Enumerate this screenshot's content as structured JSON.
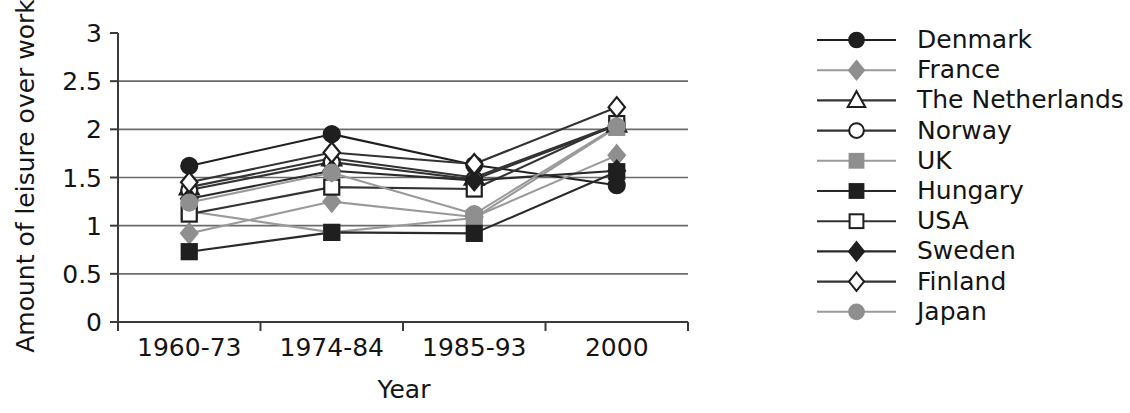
{
  "chart_data": {
    "type": "line",
    "title": "",
    "xlabel": "Year",
    "ylabel": "Amount of leisure over work",
    "categories": [
      "1960-73",
      "1974-84",
      "1985-93",
      "2000"
    ],
    "ylim": [
      0,
      3
    ],
    "yticks": [
      "0",
      "0.5",
      "1",
      "1.5",
      "2",
      "2.5",
      "3"
    ],
    "ytick_values": [
      0,
      0.5,
      1,
      1.5,
      2,
      2.5,
      3
    ],
    "grid": "horizontal",
    "legend_position": "right",
    "series": [
      {
        "name": "Denmark",
        "marker": "filled-circle",
        "color": "#1f1f1f",
        "marker_fill": "#1f1f1f",
        "values": [
          1.62,
          1.95,
          1.63,
          1.42
        ]
      },
      {
        "name": "France",
        "marker": "filled-diamond",
        "color": "#9a9a9a",
        "marker_fill": "#8f8f8f",
        "values": [
          0.92,
          1.25,
          1.09,
          1.73
        ]
      },
      {
        "name": "The Netherlands",
        "marker": "open-triangle",
        "color": "#333333",
        "marker_fill": "#ffffff",
        "values": [
          1.4,
          1.7,
          1.5,
          2.05
        ]
      },
      {
        "name": "Norway",
        "marker": "open-circle",
        "color": "#333333",
        "marker_fill": "#ffffff",
        "values": [
          1.37,
          1.66,
          1.48,
          2.04
        ]
      },
      {
        "name": "UK",
        "marker": "filled-square",
        "color": "#9a9a9a",
        "marker_fill": "#8f8f8f",
        "values": [
          1.15,
          0.93,
          1.08,
          2.02
        ]
      },
      {
        "name": "Hungary",
        "marker": "filled-square",
        "color": "#2a2a2a",
        "marker_fill": "#1f1f1f",
        "values": [
          0.73,
          0.93,
          0.92,
          1.56
        ]
      },
      {
        "name": "USA",
        "marker": "open-square",
        "color": "#333333",
        "marker_fill": "#ffffff",
        "values": [
          1.12,
          1.4,
          1.38,
          2.06
        ]
      },
      {
        "name": "Sweden",
        "marker": "filled-diamond",
        "color": "#2a2a2a",
        "marker_fill": "#1f1f1f",
        "values": [
          1.28,
          1.57,
          1.47,
          1.57
        ]
      },
      {
        "name": "Finland",
        "marker": "open-diamond",
        "color": "#333333",
        "marker_fill": "#ffffff",
        "values": [
          1.45,
          1.76,
          1.64,
          2.23
        ]
      },
      {
        "name": "Japan",
        "marker": "filled-circle",
        "color": "#9a9a9a",
        "marker_fill": "#8f8f8f",
        "values": [
          1.24,
          1.55,
          1.12,
          2.03
        ]
      }
    ]
  }
}
